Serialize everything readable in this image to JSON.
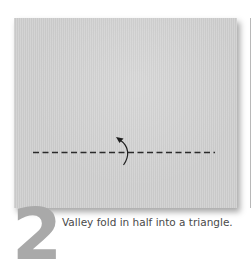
{
  "diagram": {
    "step": {
      "number": "2",
      "instruction": "Valley fold in half into a triangle."
    },
    "paper": {
      "color": "#cfcfcf",
      "shadow_color": "#8a8a8a"
    },
    "fold_line": {
      "type": "valley-fold",
      "style": "dashed",
      "color": "#2b2b2b"
    },
    "arrow": {
      "type": "fold-arrow",
      "direction": "up",
      "color": "#1f1f1f"
    },
    "step_number_color": "#a9a9a9",
    "caption_color": "#4a4a4a"
  }
}
